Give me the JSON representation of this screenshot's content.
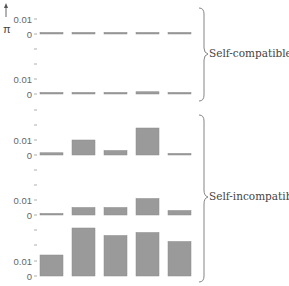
{
  "chart_data": {
    "type": "bar",
    "title": "",
    "ylabel": "π",
    "xlabel": "",
    "categories": [
      "1",
      "2",
      "3",
      "4",
      "5"
    ],
    "panel_ylim": [
      0,
      0.01
    ],
    "ytick_labels": [
      "0",
      "0.01"
    ],
    "grid": false,
    "panels": [
      {
        "name": "panel-1",
        "group": "Self-compatible",
        "values": [
          0.0005,
          0.0005,
          0.0005,
          0.0005,
          0.001
        ]
      },
      {
        "name": "panel-2",
        "group": "Self-compatible",
        "values": [
          0.001,
          0.001,
          0.0005,
          0.0015,
          0.001
        ]
      },
      {
        "name": "panel-3",
        "group": "Self-incompatible",
        "values": [
          0.0015,
          0.01,
          0.003,
          0.018,
          0.001
        ]
      },
      {
        "name": "panel-4",
        "group": "Self-incompatible",
        "values": [
          0.001,
          0.005,
          0.005,
          0.011,
          0.003
        ]
      },
      {
        "name": "panel-5",
        "group": "Self-incompatible",
        "values": [
          0.014,
          0.032,
          0.027,
          0.029,
          0.023
        ]
      }
    ],
    "groups": [
      {
        "label": "Self-compatible",
        "panels": [
          "panel-1",
          "panel-2"
        ]
      },
      {
        "label": "Self-incompatible",
        "panels": [
          "panel-3",
          "panel-4",
          "panel-5"
        ]
      }
    ]
  },
  "axis": {
    "y_symbol": "π",
    "tick_zero": "0",
    "tick_001": "0.01"
  },
  "style": {
    "bar_color": "#9a9a9a",
    "axis_color": "#999999",
    "text_color": "#555555"
  }
}
